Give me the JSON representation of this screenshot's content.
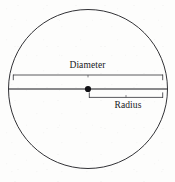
{
  "figure": {
    "type": "geometry-diagram",
    "background_color": "#fdfdfc",
    "stroke_color": "#1b1b1f",
    "labels": {
      "diameter": "Diameter",
      "radius": "Radius"
    },
    "circle": {
      "center_x": 88,
      "center_y": 89,
      "radius": 80,
      "stroke_width": 0.9
    },
    "center_point": {
      "x": 88,
      "y": 89,
      "dot_radius": 3.1
    },
    "diameter_line": {
      "x1": 9,
      "y1": 89,
      "x2": 167,
      "y2": 89,
      "stroke_width": 1.1
    },
    "diameter_bracket": {
      "x1": 13,
      "x2": 163,
      "y": 75,
      "tick_direction": "down",
      "tick_length": 5,
      "center_tick": true,
      "stroke_width": 0.8
    },
    "radius_bracket": {
      "x1": 89,
      "x2": 163,
      "y": 97,
      "tick_direction": "up",
      "tick_length": 5,
      "center_tick": true,
      "stroke_width": 0.8
    }
  }
}
